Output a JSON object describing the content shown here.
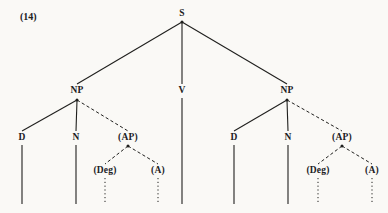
{
  "figure": {
    "example_number": "(14)",
    "example_number_x": 20,
    "example_number_y": 12,
    "background_color": "#faf9f6",
    "ink_color": "#20201e",
    "width": 388,
    "height": 213
  },
  "tree": {
    "type": "syntax-tree",
    "nodes": [
      {
        "id": "S",
        "label": "S",
        "x": 182,
        "y": 14
      },
      {
        "id": "NP1",
        "label": "NP",
        "x": 77,
        "y": 91
      },
      {
        "id": "V",
        "label": "V",
        "x": 182,
        "y": 91
      },
      {
        "id": "NP2",
        "label": "NP",
        "x": 287,
        "y": 91
      },
      {
        "id": "D1",
        "label": "D",
        "x": 22,
        "y": 138
      },
      {
        "id": "N1",
        "label": "N",
        "x": 76,
        "y": 138
      },
      {
        "id": "AP1",
        "label": "(AP)",
        "x": 128,
        "y": 138
      },
      {
        "id": "Deg1",
        "label": "(Deg)",
        "x": 105,
        "y": 171
      },
      {
        "id": "A1",
        "label": "(A)",
        "x": 158,
        "y": 171
      },
      {
        "id": "D2",
        "label": "D",
        "x": 234,
        "y": 138
      },
      {
        "id": "N2",
        "label": "N",
        "x": 288,
        "y": 138
      },
      {
        "id": "AP2",
        "label": "(AP)",
        "x": 342,
        "y": 138
      },
      {
        "id": "Deg2",
        "label": "(Deg)",
        "x": 318,
        "y": 171
      },
      {
        "id": "A2",
        "label": "(A)",
        "x": 372,
        "y": 171
      }
    ],
    "edges": [
      {
        "id": "S-NP1",
        "from": "S",
        "to": "NP1",
        "x1": 182,
        "y1": 22,
        "x2": 77,
        "y2": 84,
        "style": "solid"
      },
      {
        "id": "S-V",
        "from": "S",
        "to": "V",
        "x1": 182,
        "y1": 22,
        "x2": 182,
        "y2": 84,
        "style": "solid"
      },
      {
        "id": "S-NP2",
        "from": "S",
        "to": "NP2",
        "x1": 182,
        "y1": 22,
        "x2": 287,
        "y2": 84,
        "style": "solid"
      },
      {
        "id": "NP1-D1",
        "from": "NP1",
        "to": "D1",
        "x1": 77,
        "y1": 100,
        "x2": 22,
        "y2": 131,
        "style": "solid"
      },
      {
        "id": "NP1-N1",
        "from": "NP1",
        "to": "N1",
        "x1": 77,
        "y1": 100,
        "x2": 76,
        "y2": 131,
        "style": "solid"
      },
      {
        "id": "NP1-AP1",
        "from": "NP1",
        "to": "AP1",
        "x1": 77,
        "y1": 100,
        "x2": 128,
        "y2": 131,
        "style": "dashed"
      },
      {
        "id": "AP1-Deg1",
        "from": "AP1",
        "to": "Deg1",
        "x1": 128,
        "y1": 146,
        "x2": 105,
        "y2": 164,
        "style": "dashed"
      },
      {
        "id": "AP1-A1",
        "from": "AP1",
        "to": "A1",
        "x1": 128,
        "y1": 146,
        "x2": 158,
        "y2": 164,
        "style": "dashed"
      },
      {
        "id": "NP2-D2",
        "from": "NP2",
        "to": "D2",
        "x1": 287,
        "y1": 100,
        "x2": 234,
        "y2": 131,
        "style": "solid"
      },
      {
        "id": "NP2-N2",
        "from": "NP2",
        "to": "N2",
        "x1": 287,
        "y1": 100,
        "x2": 288,
        "y2": 131,
        "style": "solid"
      },
      {
        "id": "NP2-AP2",
        "from": "NP2",
        "to": "AP2",
        "x1": 287,
        "y1": 100,
        "x2": 342,
        "y2": 131,
        "style": "dashed"
      },
      {
        "id": "AP2-Deg2",
        "from": "AP2",
        "to": "Deg2",
        "x1": 342,
        "y1": 146,
        "x2": 318,
        "y2": 164,
        "style": "dashed"
      },
      {
        "id": "AP2-A2",
        "from": "AP2",
        "to": "A2",
        "x1": 342,
        "y1": 146,
        "x2": 372,
        "y2": 164,
        "style": "dashed"
      },
      {
        "id": "V-leaf",
        "from": "V",
        "to": "leaf",
        "x1": 182,
        "y1": 98,
        "x2": 182,
        "y2": 204,
        "style": "solid"
      },
      {
        "id": "D1-leaf",
        "from": "D1",
        "to": "leaf",
        "x1": 22,
        "y1": 145,
        "x2": 22,
        "y2": 204,
        "style": "solid"
      },
      {
        "id": "N1-leaf",
        "from": "N1",
        "to": "leaf",
        "x1": 76,
        "y1": 145,
        "x2": 76,
        "y2": 204,
        "style": "solid"
      },
      {
        "id": "Deg1-leaf",
        "from": "Deg1",
        "to": "leaf",
        "x1": 105,
        "y1": 178,
        "x2": 105,
        "y2": 204,
        "style": "dotted"
      },
      {
        "id": "A1-leaf",
        "from": "A1",
        "to": "leaf",
        "x1": 158,
        "y1": 178,
        "x2": 158,
        "y2": 204,
        "style": "dotted"
      },
      {
        "id": "D2-leaf",
        "from": "D2",
        "to": "leaf",
        "x1": 234,
        "y1": 145,
        "x2": 234,
        "y2": 204,
        "style": "solid"
      },
      {
        "id": "N2-leaf",
        "from": "N2",
        "to": "leaf",
        "x1": 288,
        "y1": 145,
        "x2": 288,
        "y2": 204,
        "style": "solid"
      },
      {
        "id": "Deg2-leaf",
        "from": "Deg2",
        "to": "leaf",
        "x1": 318,
        "y1": 178,
        "x2": 318,
        "y2": 204,
        "style": "dotted"
      },
      {
        "id": "A2-leaf",
        "from": "A2",
        "to": "leaf",
        "x1": 372,
        "y1": 178,
        "x2": 372,
        "y2": 204,
        "style": "dotted"
      }
    ],
    "junction_dots": [
      {
        "id": "dot-S",
        "x": 182,
        "y": 22
      },
      {
        "id": "dot-NP1",
        "x": 77,
        "y": 100
      },
      {
        "id": "dot-NP2",
        "x": 287,
        "y": 100
      },
      {
        "id": "dot-AP1",
        "x": 128,
        "y": 146
      },
      {
        "id": "dot-AP2",
        "x": 342,
        "y": 146
      }
    ]
  }
}
